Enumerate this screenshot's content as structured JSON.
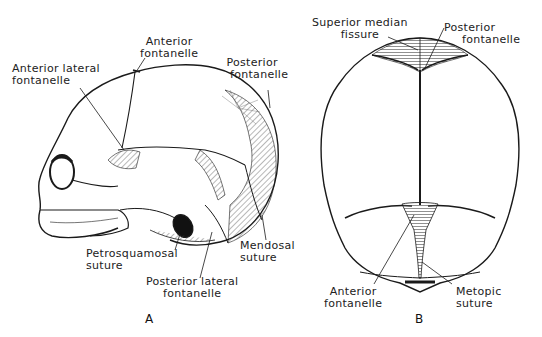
{
  "figure_a": {
    "letter": "A",
    "labels": {
      "anterior_fontanelle": [
        "Anterior",
        "fontanelle"
      ],
      "anterior_lateral_fontanelle": [
        "Anterior lateral",
        "fontanelle"
      ],
      "posterior_fontanelle": [
        "Posterior",
        "fontanelle"
      ],
      "petrosquamosal_suture": [
        "Petrosquamosal",
        "suture"
      ],
      "posterior_lateral_fontanelle": [
        "Posterior lateral",
        "fontanelle"
      ],
      "mendosal_suture": [
        "Mendosal",
        "suture"
      ]
    }
  },
  "figure_b": {
    "letter": "B",
    "labels": {
      "superior_median_fissure": [
        "Superior median",
        "fissure"
      ],
      "posterior_fontanelle": [
        "Posterior",
        "fontanelle"
      ],
      "anterior_fontanelle": [
        "Anterior",
        "fontanelle"
      ],
      "metopic_suture": [
        "Metopic",
        "suture"
      ]
    }
  }
}
